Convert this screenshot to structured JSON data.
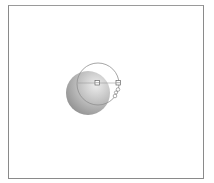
{
  "canvas": {
    "background": "#ffffff",
    "frame_color": "#8a8a8a"
  },
  "gradient_widget": {
    "type": "radial-gradient-annotator",
    "sphere": {
      "cx": 88,
      "cy": 93,
      "r": 22,
      "highlight_color": "#e8e8e8",
      "shadow_color": "#8c8c8c"
    },
    "outline_circle": {
      "cx": 98,
      "cy": 84,
      "r": 21,
      "stroke": "#9a9a9a"
    },
    "center_handle": {
      "x": 97,
      "y": 83
    },
    "radius_handle": {
      "x": 118,
      "y": 83
    },
    "focus_handles": [
      {
        "x": 117,
        "y": 90
      },
      {
        "x": 115,
        "y": 96
      }
    ],
    "icons": [
      "center-handle-icon",
      "radius-handle-icon",
      "focus-handle-icon",
      "angle-handle-icon"
    ]
  }
}
